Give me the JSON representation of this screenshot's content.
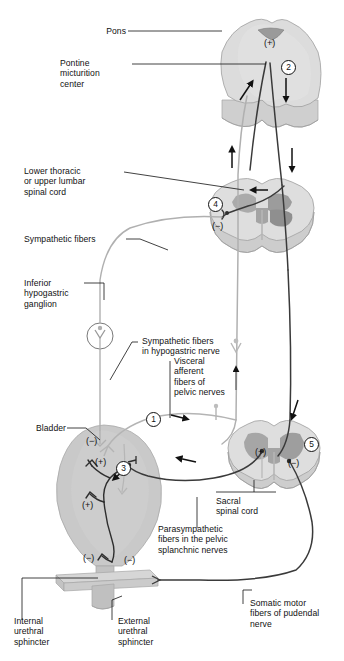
{
  "figure": {
    "colors": {
      "tissue_light": "#d9d9d9",
      "tissue_mid": "#c2c2c2",
      "gray_matter": "#a8a8a8",
      "gray_matter_dark": "#949494",
      "bladder_fill": "#c9c9c9",
      "bladder_shade": "#bdbdbd",
      "nerve_dark": "#3a3a3a",
      "nerve_light": "#b0b0b0",
      "outline": "#8f8f8f",
      "text": "#111111",
      "white": "#ffffff"
    }
  },
  "labels": {
    "pons": "Pons",
    "pontine_micturition_center": "Pontine\nmicturition\ncenter",
    "lower_thoracic": "Lower thoracic\nor upper lumbar\nspinal cord",
    "sympathetic_fibers": "Sympathetic fibers",
    "inferior_hypogastric_ganglion": "Inferior\nhypogastric\nganglion",
    "sympathetic_fibers_hypogastric": "Sympathetic fibers\nin hypogastric nerve",
    "visceral_afferent": "Visceral\nafferent\nfibers of\npelvic nerves",
    "bladder": "Bladder",
    "sacral_spinal_cord": "Sacral\nspinal cord",
    "parasympathetic_fibers": "Parasympathetic\nfibers in the pelvic\nsplanchnic nerves",
    "somatic_motor_fibers": "Somatic motor\nfibers of pudendal\nnerve",
    "internal_urethral_sphincter": "Internal\nurethral\nsphincter",
    "external_urethral_sphincter": "External\nurethral\nsphincter"
  },
  "markers": {
    "step_1": "1",
    "step_2": "2",
    "step_3": "3",
    "step_4": "4",
    "step_5": "5"
  },
  "signs": {
    "pons_plus": "(+)",
    "thoracic_minus": "(−)",
    "bladder_dome_minus": "(−)",
    "bladder_upper_plus": "(+)",
    "bladder_lower_plus": "(+)",
    "bladder_neck_minus": "(−)",
    "external_sphincter_minus": "(−)",
    "sacral_plus": "(+)",
    "sacral_minus": "(−)"
  }
}
